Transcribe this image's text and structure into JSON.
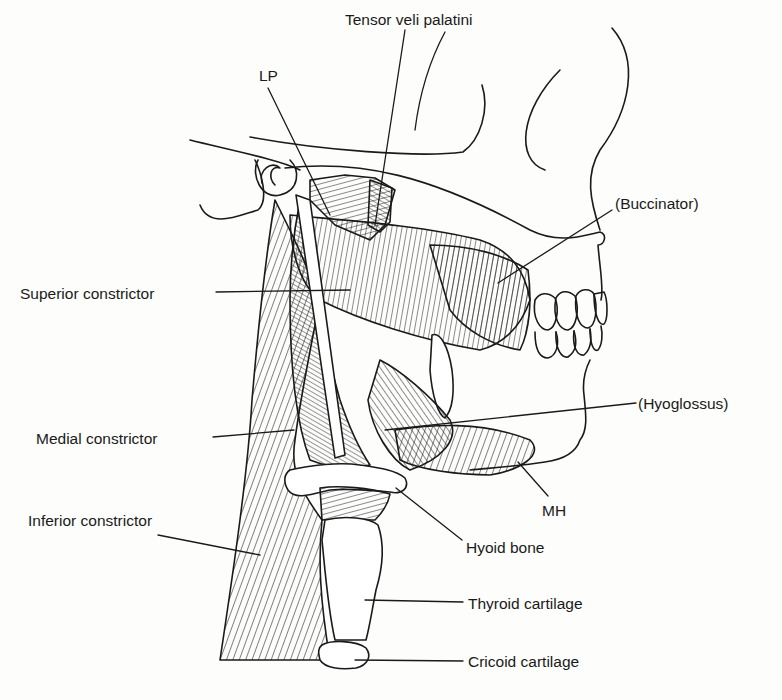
{
  "figure": {
    "type": "anatomical line illustration",
    "labels": [
      {
        "id": "tensor-veli-palatini",
        "text": "Tensor veli palatini",
        "x": 345,
        "y": 12
      },
      {
        "id": "lp",
        "text": "LP",
        "x": 259,
        "y": 68
      },
      {
        "id": "buccinator",
        "text": "(Buccinator)",
        "x": 615,
        "y": 196
      },
      {
        "id": "superior-constrictor",
        "text": "Superior constrictor",
        "x": 20,
        "y": 286
      },
      {
        "id": "hyoglossus",
        "text": "(Hyoglossus)",
        "x": 638,
        "y": 396
      },
      {
        "id": "medial-constrictor",
        "text": "Medial constrictor",
        "x": 36,
        "y": 431
      },
      {
        "id": "mh",
        "text": "MH",
        "x": 542,
        "y": 503
      },
      {
        "id": "inferior-constrictor",
        "text": "Inferior constrictor",
        "x": 28,
        "y": 513
      },
      {
        "id": "hyoid-bone",
        "text": "Hyoid bone",
        "x": 466,
        "y": 540
      },
      {
        "id": "thyroid-cartilage",
        "text": "Thyroid cartilage",
        "x": 468,
        "y": 596
      },
      {
        "id": "cricoid-cartilage",
        "text": "Cricoid cartilage",
        "x": 468,
        "y": 654
      }
    ],
    "colors": {
      "ink": "#1a1a1a",
      "paper": "#fdfdfb"
    }
  }
}
